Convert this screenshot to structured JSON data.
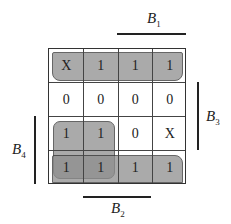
{
  "kmap": {
    "rows": [
      [
        "X",
        "1",
        "1",
        "1"
      ],
      [
        "0",
        "0",
        "0",
        "0"
      ],
      [
        "1",
        "1",
        "0",
        "X"
      ],
      [
        "1",
        "1",
        "1",
        "1"
      ]
    ],
    "groups": [
      {
        "name": "top-row-group",
        "cells": "row 0, cols 0-3"
      },
      {
        "name": "left-block-group",
        "cells": "rows 2-3, cols 0-1"
      },
      {
        "name": "bottom-row-group",
        "cells": "row 3, cols 0-3"
      }
    ],
    "variables": {
      "b1": {
        "letter": "B",
        "sub": "1"
      },
      "b2": {
        "letter": "B",
        "sub": "2"
      },
      "b3": {
        "letter": "B",
        "sub": "3"
      },
      "b4": {
        "letter": "B",
        "sub": "4"
      }
    },
    "fill_color": "#8e8e8e"
  }
}
